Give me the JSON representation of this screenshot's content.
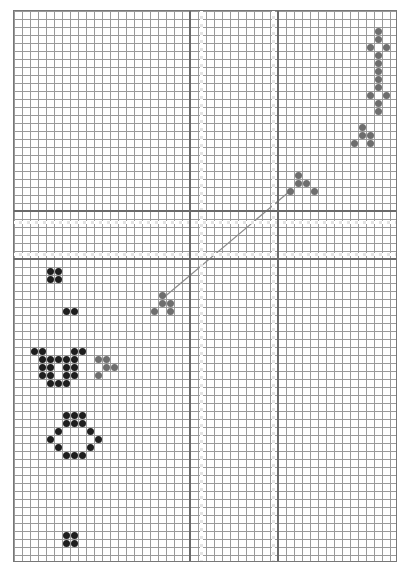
{
  "board": {
    "cols": 48,
    "rows": 69,
    "cell_px": 8,
    "colors": {
      "live": "#1e1e1e",
      "ghost": "#6e6e6e",
      "grid": "#9a9a9a",
      "major": "#6a6a6a"
    },
    "major_vertical_cols": [
      22,
      33
    ],
    "major_horizontal_rows": [
      25,
      31
    ],
    "gap_vertical_cols": [
      23,
      32
    ],
    "gap_horizontal_rows": [
      26,
      30
    ]
  },
  "patterns": [
    {
      "name": "pentadecathlon",
      "kind": "live-ghost",
      "cells": [
        [
          45,
          2
        ],
        [
          45,
          3
        ],
        [
          44,
          4
        ],
        [
          46,
          4
        ],
        [
          45,
          5
        ],
        [
          45,
          6
        ],
        [
          45,
          7
        ],
        [
          45,
          8
        ],
        [
          45,
          9
        ],
        [
          44,
          10
        ],
        [
          46,
          10
        ],
        [
          45,
          11
        ],
        [
          45,
          12
        ]
      ]
    },
    {
      "name": "glider-top-right",
      "kind": "ghost",
      "cells": [
        [
          43,
          14
        ],
        [
          43,
          15
        ],
        [
          44,
          15
        ],
        [
          42,
          16
        ],
        [
          44,
          16
        ]
      ]
    },
    {
      "name": "glider-mid-right",
      "kind": "ghost",
      "cells": [
        [
          35,
          20
        ],
        [
          35,
          21
        ],
        [
          36,
          21
        ],
        [
          37,
          22
        ],
        [
          34,
          22
        ]
      ]
    },
    {
      "name": "glider-mid-left",
      "kind": "ghost",
      "cells": [
        [
          18,
          35
        ],
        [
          18,
          36
        ],
        [
          19,
          36
        ],
        [
          17,
          37
        ],
        [
          19,
          37
        ]
      ]
    },
    {
      "name": "glider-left",
      "kind": "ghost",
      "cells": [
        [
          10,
          43
        ],
        [
          11,
          43
        ],
        [
          11,
          44
        ],
        [
          12,
          44
        ],
        [
          10,
          45
        ]
      ]
    },
    {
      "name": "block-upper-left",
      "kind": "live",
      "cells": [
        [
          4,
          32
        ],
        [
          5,
          32
        ],
        [
          4,
          33
        ],
        [
          5,
          33
        ]
      ]
    },
    {
      "name": "pair-left",
      "kind": "live",
      "cells": [
        [
          6,
          37
        ],
        [
          7,
          37
        ]
      ]
    },
    {
      "name": "cluster-left",
      "kind": "live",
      "cells": [
        [
          2,
          42
        ],
        [
          3,
          42
        ],
        [
          7,
          42
        ],
        [
          8,
          42
        ],
        [
          3,
          43
        ],
        [
          4,
          43
        ],
        [
          5,
          43
        ],
        [
          6,
          43
        ],
        [
          7,
          43
        ],
        [
          3,
          44
        ],
        [
          4,
          44
        ],
        [
          6,
          44
        ],
        [
          7,
          44
        ],
        [
          3,
          45
        ],
        [
          4,
          45
        ],
        [
          6,
          45
        ],
        [
          7,
          45
        ],
        [
          4,
          46
        ],
        [
          5,
          46
        ],
        [
          6,
          46
        ]
      ]
    },
    {
      "name": "ring-left",
      "kind": "live",
      "cells": [
        [
          6,
          50
        ],
        [
          7,
          50
        ],
        [
          8,
          50
        ],
        [
          6,
          51
        ],
        [
          7,
          51
        ],
        [
          8,
          51
        ],
        [
          5,
          52
        ],
        [
          9,
          52
        ],
        [
          4,
          53
        ],
        [
          10,
          53
        ],
        [
          5,
          54
        ],
        [
          9,
          54
        ],
        [
          6,
          55
        ],
        [
          7,
          55
        ],
        [
          8,
          55
        ]
      ]
    },
    {
      "name": "block-bottom-left",
      "kind": "live",
      "cells": [
        [
          6,
          65
        ],
        [
          7,
          65
        ],
        [
          6,
          66
        ],
        [
          7,
          66
        ]
      ]
    }
  ],
  "link_line": {
    "from": [
      18.5,
      36
    ],
    "to": [
      34.5,
      22.5
    ],
    "color": "#8a8a8a"
  }
}
